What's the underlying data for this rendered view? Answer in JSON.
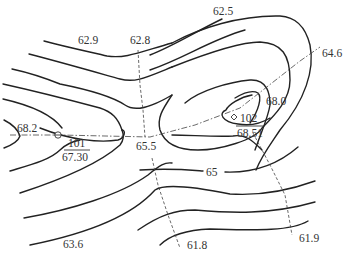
{
  "diagram": {
    "type": "topographic-contour-map",
    "colors": {
      "contour": "#222222",
      "guide": "#444444",
      "text": "#333333",
      "background": "#ffffff"
    },
    "labels": {
      "top_right_contour": "62.5",
      "top_left_contour": "62.9",
      "top_profile_end": "62.8",
      "ridge_right_end": "64.6",
      "ridge_left_end": "68.2",
      "saddle": "65.5",
      "right_hill_contour": "68.0",
      "mid_contour": "65",
      "bottom_left_contour": "63.6",
      "bottom_profile_left_end": "61.8",
      "bottom_profile_right_end": "61.9"
    },
    "benchmarks": [
      {
        "id": "101",
        "elevation": "67.30",
        "position": "left-hill"
      },
      {
        "id": "102",
        "elevation": "68.51",
        "position": "right-hill"
      }
    ]
  }
}
